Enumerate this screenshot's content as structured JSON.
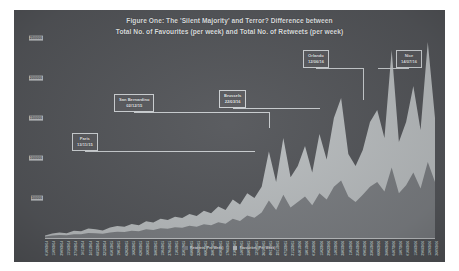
{
  "chart_data": {
    "type": "area",
    "title_lines": [
      "Figure One: The 'Silent Majority' and Terror? Difference between",
      "Total No. of Favourites (per week) and Total No. of Retweets (per week)"
    ],
    "title": "Figure One: The 'Silent Majority' and Terror? Difference between Total No. of Favourites (per week) and Total No. of Retweets (per week)",
    "xlabel": "",
    "ylabel": "",
    "ylim": [
      0,
      2500000
    ],
    "grid": false,
    "legend_position": "bottom",
    "yticks": [
      2500000,
      2000000,
      1500000,
      1000000,
      500000
    ],
    "ytick_labels": [
      "2500000",
      "2000000",
      "1500000",
      "1000000",
      "500000"
    ],
    "categories": [
      "01/09/2014",
      "15/09/2014",
      "29/09/2014",
      "13/10/2014",
      "27/10/2014",
      "10/11/2014",
      "24/11/2014",
      "08/12/2014",
      "22/12/2014",
      "05/01/2015",
      "19/01/2015",
      "02/02/2015",
      "16/02/2015",
      "02/03/2015",
      "16/03/2015",
      "30/03/2015",
      "13/04/2015",
      "27/04/2015",
      "11/05/2015",
      "25/05/2015",
      "08/06/2015",
      "22/06/2015",
      "06/07/2015",
      "20/07/2015",
      "03/08/2015",
      "17/08/2015",
      "31/08/2015",
      "14/09/2015",
      "28/09/2015",
      "12/10/2015",
      "26/10/2015",
      "09/11/2015",
      "23/11/2015",
      "07/12/2015",
      "21/12/2015",
      "04/01/2016",
      "18/01/2016",
      "01/02/2016",
      "15/02/2016",
      "29/02/2016",
      "14/03/2016",
      "28/03/2016",
      "11/04/2016",
      "25/04/2016",
      "09/05/2016",
      "23/05/2016",
      "06/06/2016",
      "20/06/2016",
      "04/07/2016",
      "18/07/2016",
      "01/08/2016",
      "15/08/2016",
      "29/08/2016",
      "12/09/2016",
      "26/09/2016"
    ],
    "xtick_labels": [
      "01/09/2014",
      "15/09/2014",
      "29/09/2014",
      "13/10/2014",
      "27/10/2014",
      "10/11/2014",
      "24/11/2014",
      "08/12/2014",
      "22/12/2014",
      "05/01/2015",
      "19/01/2015",
      "02/02/2015",
      "16/02/2015",
      "02/03/2015",
      "16/03/2015",
      "30/03/2015",
      "13/04/2015",
      "27/04/2015",
      "11/05/2015",
      "25/05/2015",
      "08/06/2015",
      "22/06/2015",
      "06/07/2015",
      "20/07/2015",
      "03/08/2015",
      "17/08/2015",
      "31/08/2015",
      "14/09/2015",
      "28/09/2015",
      "12/10/2015",
      "26/10/2015",
      "09/11/2015",
      "23/11/2015",
      "07/12/2015",
      "21/12/2015",
      "04/01/2016",
      "18/01/2016",
      "01/02/2016",
      "15/02/2016",
      "29/02/2016",
      "14/03/2016",
      "28/03/2016",
      "11/04/2016",
      "25/04/2016",
      "09/05/2016",
      "23/05/2016",
      "06/06/2016",
      "20/06/2016",
      "04/07/2016",
      "18/07/2016",
      "01/08/2016",
      "15/08/2016",
      "29/08/2016",
      "12/09/2016",
      "26/09/2016"
    ],
    "series": [
      {
        "name": "Favourites (Per Week)",
        "color": "#b9bdbf",
        "values": [
          30000,
          55000,
          70000,
          60000,
          90000,
          85000,
          120000,
          110000,
          95000,
          130000,
          150000,
          140000,
          175000,
          160000,
          210000,
          195000,
          240000,
          225000,
          265000,
          250000,
          300000,
          275000,
          340000,
          310000,
          395000,
          350000,
          480000,
          420000,
          560000,
          500000,
          640000,
          1080000,
          700000,
          1250000,
          760000,
          900000,
          1150000,
          820000,
          1300000,
          980000,
          1500000,
          1750000,
          1050000,
          900000,
          1100000,
          1450000,
          1600000,
          1250000,
          2350000,
          1200000,
          1450000,
          1900000,
          1350000,
          2450000,
          1500000
        ]
      },
      {
        "name": "Retweets (Per Week)",
        "color": "#7b7e82",
        "values": [
          18000,
          30000,
          38000,
          34000,
          48000,
          46000,
          62000,
          58000,
          52000,
          68000,
          78000,
          74000,
          90000,
          84000,
          108000,
          100000,
          122000,
          116000,
          135000,
          128000,
          152000,
          142000,
          172000,
          158000,
          198000,
          178000,
          240000,
          212000,
          280000,
          252000,
          320000,
          470000,
          350000,
          540000,
          380000,
          450000,
          520000,
          410000,
          560000,
          480000,
          640000,
          720000,
          520000,
          450000,
          540000,
          640000,
          700000,
          580000,
          880000,
          560000,
          660000,
          820000,
          620000,
          950000,
          700000
        ]
      }
    ],
    "legend": [
      {
        "label": "Retweets (Per Week)",
        "color": "#7b7e82"
      },
      {
        "label": "Favourites (Per Week)",
        "color": "#b9bdbf"
      }
    ],
    "annotations": [
      {
        "name": "Paris",
        "date": "13/11/15",
        "x_index": 31
      },
      {
        "name": "San Bernardino",
        "date": "02/12/15",
        "x_index": 33
      },
      {
        "name": "Brussels",
        "date": "22/03/16",
        "x_index": 40
      },
      {
        "name": "Orlando",
        "date": "12/06/16",
        "x_index": 46
      },
      {
        "name": "Nice",
        "date": "14/07/16",
        "x_index": 48
      }
    ]
  },
  "theme": {
    "background": "#54565a",
    "plot_background": "#54565a",
    "text_color": "#e8eaec",
    "favourites_color": "#b9bdbf",
    "retweets_color": "#7b7e82",
    "axis_color": "#d7dadc"
  }
}
